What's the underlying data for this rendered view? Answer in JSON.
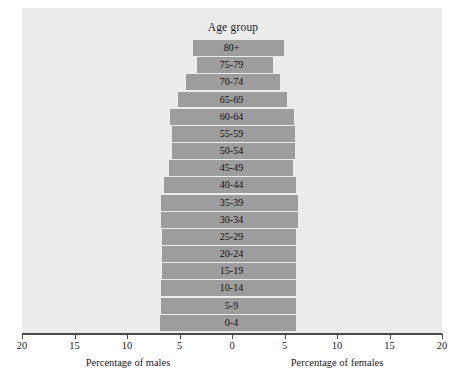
{
  "chart_data": {
    "type": "bar",
    "subtype": "population-pyramid",
    "title": "Age group",
    "xlabel": "",
    "ylabel": "",
    "left_axis_label": "Percentage of males",
    "right_axis_label": "Percentage of females",
    "grid": false,
    "legend": "none",
    "xlim": [
      -20,
      20
    ],
    "axis_max": 20,
    "tick_values": [
      20,
      15,
      10,
      5,
      0,
      5,
      10,
      15,
      20
    ],
    "tick_labels": [
      "20",
      "15",
      "10",
      "5",
      "0",
      "5",
      "10",
      "15",
      "20"
    ],
    "categories": [
      "80+",
      "75-79",
      "70-74",
      "65-69",
      "60-64",
      "55-59",
      "50-54",
      "45-49",
      "40-44",
      "35-39",
      "30-34",
      "25-29",
      "20-24",
      "15-19",
      "10-14",
      "5-9",
      "0-4"
    ],
    "series": [
      {
        "name": "Percentage of males",
        "side": "left",
        "values": [
          3.7,
          3.3,
          4.4,
          5.1,
          5.9,
          5.7,
          5.7,
          6.0,
          6.5,
          6.8,
          6.8,
          6.7,
          6.7,
          6.7,
          6.8,
          6.8,
          6.9
        ]
      },
      {
        "name": "Percentage of females",
        "side": "right",
        "values": [
          5.0,
          3.9,
          4.6,
          5.2,
          5.9,
          6.0,
          6.0,
          5.8,
          6.1,
          6.3,
          6.3,
          6.1,
          6.1,
          6.1,
          6.1,
          6.1,
          6.1
        ]
      }
    ],
    "colors": {
      "bar": "#9d9d9d",
      "panel_background": "#ececec",
      "axis": "#4a4a4a",
      "text": "#1b1b1b"
    }
  }
}
